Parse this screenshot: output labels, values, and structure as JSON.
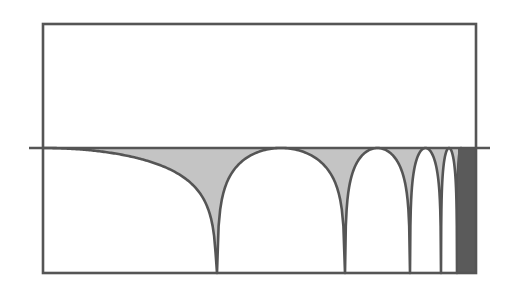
{
  "figure": {
    "type": "magnitude-response-diagram",
    "colors": {
      "background": "#ffffff",
      "line": "#555555",
      "fill": "#c4c4c4",
      "dense": "#5a5a5a"
    },
    "frame": {
      "left": 43,
      "top": 24,
      "right": 476,
      "bottom": 273
    },
    "axis": {
      "y": 148,
      "x_start": 29,
      "x_end": 490
    },
    "db_range": 45,
    "first_lobe": {
      "peak_x": 43,
      "null_x": 217
    },
    "nulls_x": [
      217,
      345,
      410,
      441,
      457,
      465,
      469,
      471.5,
      473
    ],
    "dense_region": {
      "x_start": 458,
      "x_end": 476
    },
    "labels": []
  },
  "chart_data": {
    "type": "line",
    "title": "",
    "xlabel": "",
    "ylabel": "",
    "grid": false,
    "legend": "none",
    "series": [
      {
        "name": "magnitude response (dB)",
        "null_positions_px": [
          217,
          345,
          410,
          441,
          457
        ],
        "peak_positions_px": [
          43,
          281,
          377.5,
          425.5,
          449
        ],
        "peak_level": "0 dB (axis line)",
        "null_level": "-infinity (clipped at bottom frame)"
      }
    ],
    "annotations": [
      "shaded area between curve and 0 dB line",
      "lobes compress toward right edge (dense dark band)"
    ]
  }
}
